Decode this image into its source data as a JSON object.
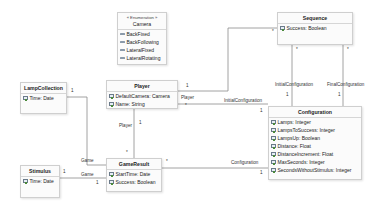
{
  "diagram": {
    "type": "UML class diagram",
    "classes": {
      "camera": {
        "stereotype": "« Enumeration »",
        "name": "Camera",
        "literals": [
          "BackFixed",
          "BackFollowing",
          "LateralFixed",
          "LateralRotating"
        ]
      },
      "sequence": {
        "name": "Sequence",
        "attributes": [
          "Success: Boolean"
        ]
      },
      "lamp_collection": {
        "name": "LampCollection",
        "attributes": [
          "Time: Date"
        ]
      },
      "player": {
        "name": "Player",
        "attributes": [
          "DefaultCamera: Camera",
          "Name: String"
        ]
      },
      "stimulus": {
        "name": "Stimulus",
        "attributes": [
          "Time: Date"
        ]
      },
      "game_result": {
        "name": "GameResult",
        "attributes": [
          "StartTime: Date",
          "Success: Boolean"
        ]
      },
      "configuration": {
        "name": "Configuration",
        "attributes": [
          "Lamps: Integer",
          "LampsToSuccess: Integer",
          "LampsUp: Boolean",
          "Distance: Float",
          "DistanceIncrement: Float",
          "MaxSeconds: Integer",
          "SecondsWithoutStimulus: Integer"
        ]
      }
    },
    "associations": {
      "player_sequence": {
        "player_mult": "1",
        "sequence_mult": "*"
      },
      "player_configuration": {
        "role_player": "Player",
        "player_mult": "*",
        "role_config": "InitialConfiguration",
        "config_mult": "1"
      },
      "player_gameresult": {
        "role_player": "Player",
        "player_mult": "1",
        "gameresult_mult": "*"
      },
      "lampcollection_gameresult": {
        "lamp_mult": "1",
        "role_game": "Game"
      },
      "stimulus_gameresult": {
        "stimulus_mult": "1",
        "role_game": "Game",
        "game_mult": "1"
      },
      "gameresult_configuration": {
        "gameresult_mult": "*",
        "role_config": "Configuration",
        "config_mult": "1"
      },
      "sequence_initial_config": {
        "sequence_mult": "*",
        "role": "InitialConfiguration",
        "config_mult": "1"
      },
      "sequence_final_config": {
        "sequence_mult": "*",
        "role": "FinalConfiguration",
        "config_mult": "1"
      }
    },
    "colors": {
      "line": "#8a8a8a",
      "box_border": "#cfcfcf",
      "box_fill": "#fbfbfb"
    }
  }
}
